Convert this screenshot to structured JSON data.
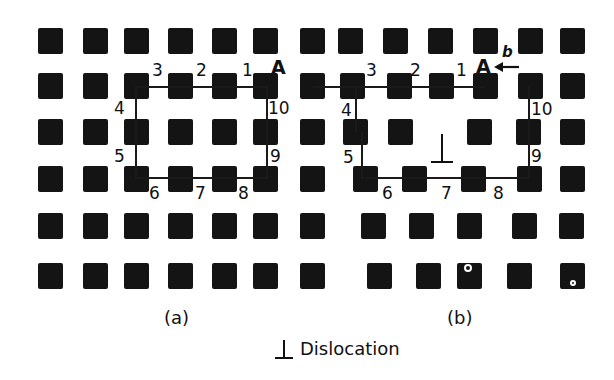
{
  "figure": {
    "panel_a": {
      "caption": "(a)",
      "circuit_labels": [
        "1",
        "2",
        "3",
        "4",
        "5",
        "6",
        "7",
        "8",
        "9",
        "10"
      ],
      "start_label": "A"
    },
    "panel_b": {
      "caption": "(b)",
      "circuit_labels": [
        "1",
        "2",
        "3",
        "4",
        "5",
        "6",
        "7",
        "8",
        "9",
        "10"
      ],
      "start_label": "A",
      "burgers_vector_label": "b",
      "dislocation_symbol": "⊥"
    },
    "legend": {
      "symbol": "⊥",
      "text": "Dislocation"
    }
  },
  "colors": {
    "atom": "#141414",
    "background": "#ffffff",
    "line": "#1a1a1a"
  },
  "atoms": {
    "size": 25,
    "panel_a": {
      "cols": [
        38,
        83,
        124,
        168,
        212,
        253,
        300
      ],
      "rows": [
        28,
        73,
        119,
        166,
        213,
        263
      ]
    },
    "panel_b": [
      {
        "row": 28,
        "cols": [
          300,
          338,
          383,
          428,
          473,
          518,
          560
        ]
      },
      {
        "row": 73,
        "cols": [
          300,
          340,
          387,
          429,
          473,
          518,
          560
        ]
      },
      {
        "row": 119,
        "cols": [
          300,
          343,
          388,
          467,
          516,
          560
        ]
      },
      {
        "row": 166,
        "cols": [
          300,
          353,
          402,
          461,
          517,
          560
        ]
      },
      {
        "row": 213,
        "cols": [
          300,
          361,
          409,
          457,
          512,
          559
        ]
      },
      {
        "row": 263,
        "cols": [
          300,
          367,
          416,
          457,
          507,
          560
        ]
      }
    ]
  }
}
